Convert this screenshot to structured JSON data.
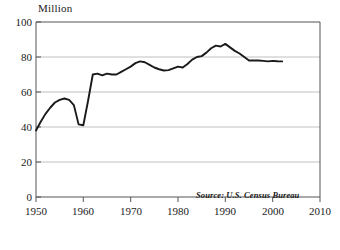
{
  "chart_data": {
    "type": "line",
    "title": "",
    "subtitle": "",
    "xlabel": "",
    "ylabel": "Million",
    "y_axis_title": "Million",
    "xlim": [
      1950,
      2010
    ],
    "ylim": [
      0,
      100
    ],
    "grid": "horizontal",
    "legend": "none",
    "source_note": "Source: U.S. Census Bureau",
    "xticks": [
      1950,
      1960,
      1970,
      1980,
      1990,
      2000,
      2010
    ],
    "xtick_labels": [
      "1950",
      "1960",
      "1970",
      "1980",
      "1990",
      "2000",
      "2010"
    ],
    "yticks": [
      0,
      20,
      40,
      60,
      80,
      100
    ],
    "ytick_labels": [
      "0",
      "20",
      "40",
      "60",
      "80",
      "100"
    ],
    "line_color": "#1a1a1a",
    "grid_color": "#b0b0b0",
    "axis_color": "#555555",
    "background_color": "#ffffff",
    "series": [
      {
        "name": "Million",
        "x": [
          1950,
          1951,
          1952,
          1953,
          1954,
          1955,
          1956,
          1957,
          1958,
          1959,
          1960,
          1961,
          1962,
          1963,
          1964,
          1965,
          1966,
          1967,
          1968,
          1969,
          1970,
          1971,
          1972,
          1973,
          1974,
          1975,
          1976,
          1977,
          1978,
          1979,
          1980,
          1981,
          1982,
          1983,
          1984,
          1985,
          1986,
          1987,
          1988,
          1989,
          1990,
          1991,
          1992,
          1993,
          1994,
          1995,
          1996,
          1997,
          1998,
          1999,
          2000,
          2001,
          2002
        ],
        "values": [
          38.0,
          43.0,
          47.5,
          51.0,
          54.0,
          55.5,
          56.3,
          55.5,
          52.5,
          41.5,
          41.0,
          55.0,
          70.0,
          70.5,
          69.5,
          70.5,
          70.0,
          70.0,
          71.5,
          73.0,
          74.5,
          76.5,
          77.5,
          77.0,
          75.5,
          74.0,
          73.0,
          72.3,
          72.5,
          73.5,
          74.5,
          74.0,
          76.0,
          78.5,
          80.0,
          80.5,
          82.5,
          85.0,
          86.5,
          86.0,
          87.5,
          85.5,
          83.5,
          82.0,
          80.0,
          78.0,
          78.0,
          78.0,
          77.8,
          77.5,
          77.8,
          77.6,
          77.5
        ]
      }
    ]
  },
  "caption": {
    "text": ""
  }
}
